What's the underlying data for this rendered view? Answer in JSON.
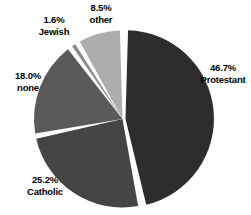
{
  "chart_data": {
    "type": "pie",
    "title": "",
    "subtitle": "",
    "xlabel": "",
    "ylabel": "",
    "legend_position": "none",
    "grid": false,
    "value_unit": "percent",
    "exploded_slice": "Protestant",
    "categories": [
      "Protestant",
      "Catholic",
      "none",
      "Jewish",
      "other"
    ],
    "values": [
      46.7,
      25.2,
      18.0,
      1.6,
      8.5
    ],
    "slices": [
      {
        "name": "Protestant",
        "value": 46.7,
        "value_label": "46.7%",
        "color": "#2d2d2d",
        "label_position": "right",
        "exploded": true
      },
      {
        "name": "Catholic",
        "value": 25.2,
        "value_label": "25.2%",
        "color": "#454545",
        "label_position": "bottom-left",
        "exploded": false
      },
      {
        "name": "none",
        "value": 18.0,
        "value_label": "18.0%",
        "color": "#5a5a5a",
        "label_position": "left",
        "exploded": false
      },
      {
        "name": "Jewish",
        "value": 1.6,
        "value_label": "1.6%",
        "color": "#8a8a8a",
        "label_position": "top-left",
        "exploded": false
      },
      {
        "name": "other",
        "value": 8.5,
        "value_label": "8.5%",
        "color": "#adadad",
        "label_position": "top",
        "exploded": false
      }
    ],
    "background_color": "#ffffff",
    "label_color": "#000000",
    "separator_color": "#ffffff"
  },
  "labels": {
    "protestant": {
      "pct": "46.7%",
      "name": "Protestant"
    },
    "catholic": {
      "pct": "25.2%",
      "name": "Catholic"
    },
    "none": {
      "pct": "18.0%",
      "name": "none"
    },
    "jewish": {
      "pct": "1.6%",
      "name": "Jewish"
    },
    "other": {
      "pct": "8.5%",
      "name": "other"
    }
  }
}
